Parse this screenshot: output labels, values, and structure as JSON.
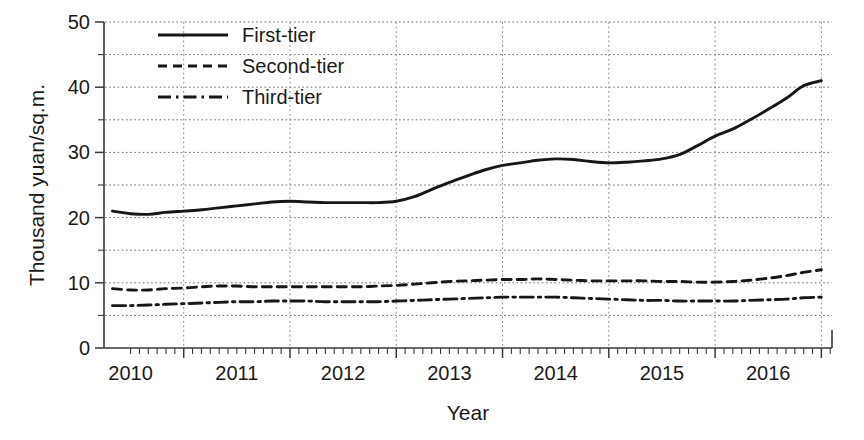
{
  "chart_data": {
    "type": "line",
    "title": "",
    "xlabel": "Year",
    "ylabel": "Thousand yuan/sq.m.",
    "xlim": [
      2009.75,
      2016.6
    ],
    "ylim": [
      0,
      50
    ],
    "yticks": [
      0,
      10,
      20,
      30,
      40,
      50
    ],
    "yticklabels": [
      "0",
      "10",
      "20",
      "30",
      "40",
      "50"
    ],
    "yminorticks": [
      5,
      15,
      25,
      35,
      45
    ],
    "xticklabels": [
      "2010",
      "2011",
      "2012",
      "2013",
      "2014",
      "2015",
      "2016"
    ],
    "xtickvalues": [
      2010,
      2011,
      2012,
      2013,
      2014,
      2015,
      2016
    ],
    "grid": {
      "horizontal": true,
      "vertical": true,
      "style": "dotted",
      "h_step": 5,
      "v_step": 1
    },
    "legend": {
      "position": "top-left",
      "frame": false
    },
    "x": [
      2009.83,
      2010.0,
      2010.17,
      2010.33,
      2010.5,
      2010.67,
      2010.83,
      2011.0,
      2011.17,
      2011.33,
      2011.5,
      2011.67,
      2011.83,
      2012.0,
      2012.17,
      2012.33,
      2012.5,
      2012.67,
      2012.83,
      2013.0,
      2013.17,
      2013.33,
      2013.5,
      2013.67,
      2013.83,
      2014.0,
      2014.17,
      2014.33,
      2014.5,
      2014.67,
      2014.83,
      2015.0,
      2015.17,
      2015.33,
      2015.5,
      2015.67,
      2015.83,
      2016.0,
      2016.17,
      2016.33,
      2016.5
    ],
    "series": [
      {
        "name": "First-tier",
        "style": "solid",
        "values": [
          21.0,
          20.6,
          20.5,
          20.8,
          21.0,
          21.2,
          21.5,
          21.8,
          22.1,
          22.4,
          22.5,
          22.4,
          22.3,
          22.3,
          22.3,
          22.3,
          22.5,
          23.2,
          24.3,
          25.4,
          26.4,
          27.3,
          28.0,
          28.4,
          28.8,
          29.0,
          28.9,
          28.6,
          28.4,
          28.5,
          28.7,
          29.0,
          29.7,
          31.0,
          32.5,
          33.6,
          35.0,
          36.6,
          38.3,
          40.2,
          41.0
        ]
      },
      {
        "name": "Second-tier",
        "style": "dashed",
        "values": [
          9.1,
          8.9,
          8.9,
          9.1,
          9.2,
          9.4,
          9.5,
          9.5,
          9.4,
          9.4,
          9.4,
          9.4,
          9.4,
          9.4,
          9.4,
          9.5,
          9.6,
          9.8,
          10.0,
          10.2,
          10.3,
          10.4,
          10.5,
          10.5,
          10.6,
          10.5,
          10.4,
          10.3,
          10.3,
          10.3,
          10.3,
          10.2,
          10.2,
          10.1,
          10.1,
          10.2,
          10.4,
          10.7,
          11.1,
          11.6,
          12.0
        ]
      },
      {
        "name": "Third-tier",
        "style": "dashdot",
        "values": [
          6.5,
          6.5,
          6.6,
          6.7,
          6.8,
          6.9,
          7.0,
          7.1,
          7.1,
          7.2,
          7.2,
          7.2,
          7.1,
          7.1,
          7.1,
          7.1,
          7.2,
          7.3,
          7.4,
          7.5,
          7.6,
          7.7,
          7.8,
          7.8,
          7.8,
          7.8,
          7.7,
          7.6,
          7.5,
          7.4,
          7.3,
          7.3,
          7.2,
          7.2,
          7.2,
          7.2,
          7.3,
          7.4,
          7.5,
          7.7,
          7.8
        ]
      }
    ]
  },
  "legend_items": [
    {
      "label": "First-tier",
      "style": "solid"
    },
    {
      "label": "Second-tier",
      "style": "dashed"
    },
    {
      "label": "Third-tier",
      "style": "dashdot"
    }
  ],
  "colors": {
    "line": "#171717",
    "axis": "#3a3a3a",
    "grid_horizontal": "#6b6b6b",
    "grid_vertical": "#8a8a8a",
    "text": "#1a1a1a",
    "background": "#ffffff"
  }
}
